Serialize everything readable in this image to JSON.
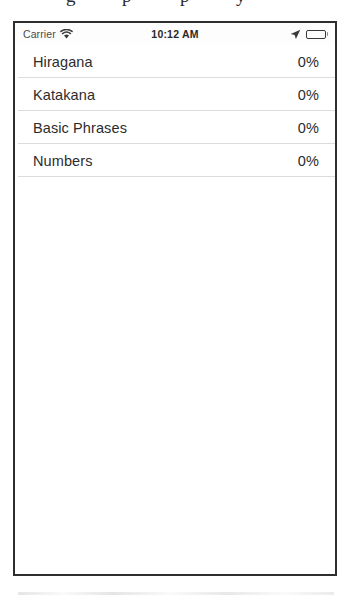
{
  "caption_fragments": [
    {
      "text": "g",
      "left": 66
    },
    {
      "text": "p",
      "left": 122
    },
    {
      "text": "p",
      "left": 180
    },
    {
      "text": "y",
      "left": 236
    }
  ],
  "status_bar": {
    "carrier": "Carrier",
    "wifi_icon": "wifi-icon",
    "time": "10:12 AM",
    "location_icon": "location-arrow-icon",
    "battery_icon": "battery-icon",
    "battery_level_percent": 70
  },
  "table": {
    "rows": [
      {
        "title": "Hiragana",
        "value": "0%"
      },
      {
        "title": "Katakana",
        "value": "0%"
      },
      {
        "title": "Basic Phrases",
        "value": "0%"
      },
      {
        "title": "Numbers",
        "value": "0%"
      }
    ]
  },
  "colors": {
    "frame_border": "#2e2e2e",
    "text_primary": "#2c2c2c",
    "separator": "#dcdcdc",
    "background": "#ffffff"
  }
}
